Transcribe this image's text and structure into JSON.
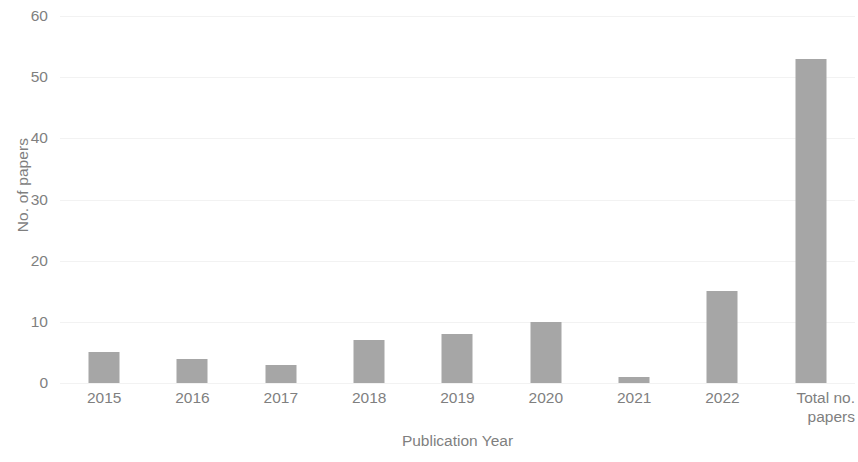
{
  "chart_data": {
    "type": "bar",
    "title": "",
    "xlabel": "Publication Year",
    "ylabel": "No. of papers",
    "categories": [
      "2015",
      "2016",
      "2017",
      "2018",
      "2019",
      "2020",
      "2021",
      "2022",
      "Total no. papers"
    ],
    "values": [
      5,
      4,
      3,
      7,
      8,
      10,
      1,
      15,
      53
    ],
    "ylim": [
      0,
      60
    ],
    "yticks": [
      0,
      10,
      20,
      30,
      40,
      50,
      60
    ],
    "ytick_labels": [
      "0",
      "10",
      "20",
      "30",
      "40",
      "50",
      "60"
    ],
    "grid": true,
    "legend": false,
    "bar_color": "#a6a6a6",
    "text_color": "#7f7f7f",
    "gridline_color": "#f2f2f2",
    "background": "#ffffff",
    "series": [
      {
        "name": "No. of papers",
        "values": [
          5,
          4,
          3,
          7,
          8,
          10,
          1,
          15,
          53
        ]
      }
    ]
  },
  "axis": {
    "y_title": "No. of papers",
    "x_title": "Publication Year"
  },
  "x_labels": [
    {
      "line1": "2015",
      "line2": ""
    },
    {
      "line1": "2016",
      "line2": ""
    },
    {
      "line1": "2017",
      "line2": ""
    },
    {
      "line1": "2018",
      "line2": ""
    },
    {
      "line1": "2019",
      "line2": ""
    },
    {
      "line1": "2020",
      "line2": ""
    },
    {
      "line1": "2021",
      "line2": ""
    },
    {
      "line1": "2022",
      "line2": ""
    },
    {
      "line1": "Total no.",
      "line2": "papers"
    }
  ]
}
